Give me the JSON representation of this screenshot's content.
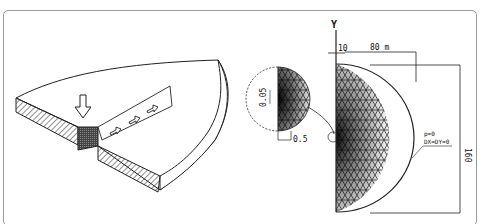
{
  "figure": {
    "left_panel": {
      "description": "Isometric view of a cut slab with hatched cross-section, downward load arrow and flow arrows along a strip"
    },
    "right_panel": {
      "description": "Finite element triangular mesh of a half-disc with refined zone at origin",
      "labels": {
        "axis_symbol": "Y",
        "offset_dim": "10",
        "radius_dim": "80 m",
        "height_dim": "160",
        "boundary_cond_line1": "p=0",
        "boundary_cond_line2": "DX=DY=0",
        "inset_dim_vertical": "0.05",
        "inset_dim_horizontal": "0.5"
      }
    }
  }
}
